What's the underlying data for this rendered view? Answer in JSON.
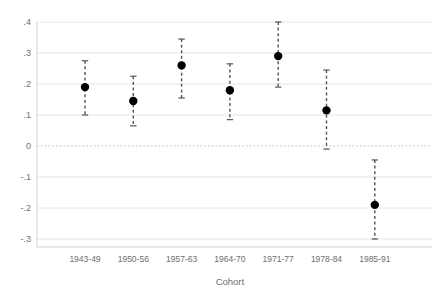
{
  "chart_data": {
    "type": "scatter",
    "title": "",
    "subtitle": "",
    "xlabel": "Cohort",
    "ylabel": "",
    "categories": [
      "1943-49",
      "1950-56",
      "1957-63",
      "1964-70",
      "1971-77",
      "1978-84",
      "1985-91"
    ],
    "values": [
      0.19,
      0.145,
      0.26,
      0.18,
      0.29,
      0.115,
      -0.19
    ],
    "ci_low": [
      0.1,
      0.065,
      0.155,
      0.085,
      0.19,
      -0.01,
      -0.3
    ],
    "ci_high": [
      0.275,
      0.225,
      0.345,
      0.265,
      0.4,
      0.245,
      -0.045
    ],
    "series": [
      {
        "name": "Estimate",
        "values": [
          0.19,
          0.145,
          0.26,
          0.18,
          0.29,
          0.115,
          -0.19
        ],
        "ci_low": [
          0.1,
          0.065,
          0.155,
          0.085,
          0.19,
          -0.01,
          -0.3
        ],
        "ci_high": [
          0.275,
          0.225,
          0.345,
          0.265,
          0.4,
          0.245,
          -0.045
        ]
      }
    ],
    "ylim": [
      -0.3,
      0.4
    ],
    "ytick_values": [
      0.4,
      0.3,
      0.2,
      0.1,
      0,
      -0.1,
      -0.2,
      -0.3
    ],
    "ytick_labels": [
      ".4",
      ".3",
      ".2",
      ".1",
      "0",
      "-.1",
      "-.2",
      "-.3"
    ],
    "grid": true,
    "grid_axis": "y",
    "legend": "none",
    "reference_line": {
      "value": 0,
      "style": "dotted"
    },
    "marker": {
      "shape": "circle",
      "filled": true,
      "color": "#000000"
    },
    "errorbar": {
      "style": "dashed",
      "color": "#555555",
      "cap": "tee"
    },
    "colors": {
      "marker": "#000000",
      "errorbar": "#555555",
      "gridline": "#e3e3e3",
      "zeroline": "#b5b5b5",
      "axis": "#b9b9b9",
      "text": "#6e6e6e",
      "background": "#ffffff"
    }
  },
  "axes": {
    "y_ticks": [
      {
        "label": ".4",
        "value": 0.4
      },
      {
        "label": ".3",
        "value": 0.3
      },
      {
        "label": ".2",
        "value": 0.2
      },
      {
        "label": ".1",
        "value": 0.1
      },
      {
        "label": "0",
        "value": 0
      },
      {
        "label": "-.1",
        "value": -0.1
      },
      {
        "label": "-.2",
        "value": -0.2
      },
      {
        "label": "-.3",
        "value": -0.3
      }
    ],
    "x_ticks": [
      {
        "label": "1943-49"
      },
      {
        "label": "1950-56"
      },
      {
        "label": "1957-63"
      },
      {
        "label": "1964-70"
      },
      {
        "label": "1971-77"
      },
      {
        "label": "1978-84"
      },
      {
        "label": "1985-91"
      }
    ],
    "x_title": "Cohort",
    "y_title": ""
  }
}
